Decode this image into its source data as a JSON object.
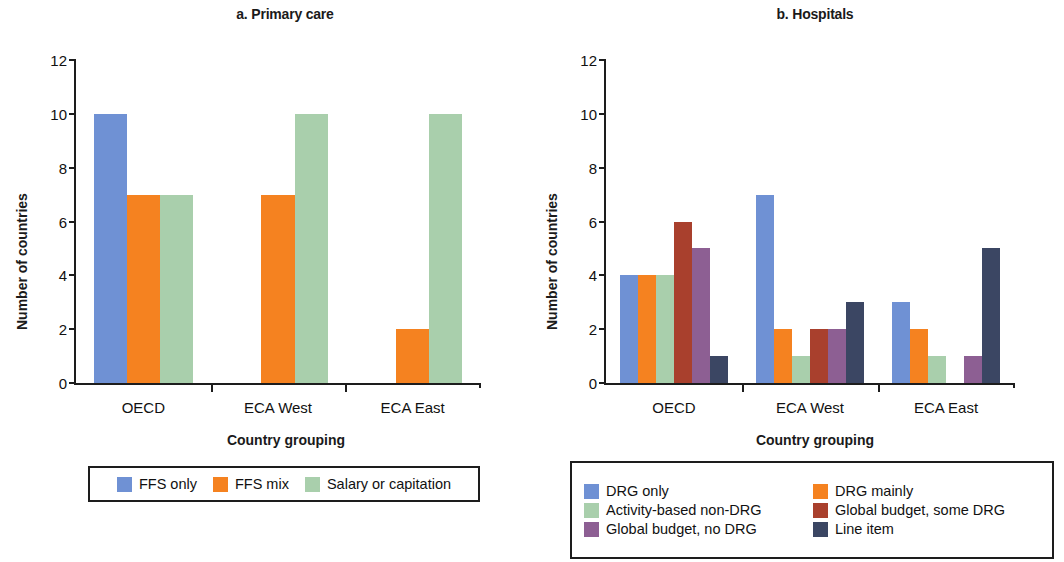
{
  "figure": {
    "panels": [
      {
        "id": "a",
        "title": "a. Primary care",
        "xlabel": "Country grouping",
        "ylabel": "Number of countries"
      },
      {
        "id": "b",
        "title": "b. Hospitals",
        "xlabel": "Country grouping",
        "ylabel": "Number of countries"
      }
    ]
  },
  "axis": {
    "yticks": [
      "0",
      "2",
      "4",
      "6",
      "8",
      "10",
      "12"
    ],
    "categories": [
      "OECD",
      "ECA West",
      "ECA East"
    ]
  },
  "colors": {
    "blue": "#6f91d4",
    "orange": "#f58220",
    "green": "#a9cfac",
    "brown": "#a9402d",
    "purple": "#8d5f93",
    "navy": "#3b4663",
    "axis": "#1d1d1d"
  },
  "chart_data": [
    {
      "type": "bar",
      "panel": "a",
      "title": "a. Primary care",
      "xlabel": "Country grouping",
      "ylabel": "Number of countries",
      "ylim": [
        0,
        12
      ],
      "yticks": [
        0,
        2,
        4,
        6,
        8,
        10,
        12
      ],
      "grid": false,
      "legend_position": "below",
      "categories": [
        "OECD",
        "ECA West",
        "ECA East"
      ],
      "series": [
        {
          "name": "FFS only",
          "color": "#6f91d4",
          "values": [
            10,
            0,
            0
          ]
        },
        {
          "name": "FFS mix",
          "color": "#f58220",
          "values": [
            7,
            7,
            2
          ]
        },
        {
          "name": "Salary or capitation",
          "color": "#a9cfac",
          "values": [
            7,
            10,
            10
          ]
        }
      ]
    },
    {
      "type": "bar",
      "panel": "b",
      "title": "b. Hospitals",
      "xlabel": "Country grouping",
      "ylabel": "Number of countries",
      "ylim": [
        0,
        12
      ],
      "yticks": [
        0,
        2,
        4,
        6,
        8,
        10,
        12
      ],
      "grid": false,
      "legend_position": "below",
      "categories": [
        "OECD",
        "ECA West",
        "ECA East"
      ],
      "series": [
        {
          "name": "DRG only",
          "color": "#6f91d4",
          "values": [
            4,
            7,
            3
          ]
        },
        {
          "name": "DRG mainly",
          "color": "#f58220",
          "values": [
            4,
            2,
            2
          ]
        },
        {
          "name": "Activity-based non-DRG",
          "color": "#a9cfac",
          "values": [
            4,
            1,
            1
          ]
        },
        {
          "name": "Global budget, some DRG",
          "color": "#a9402d",
          "values": [
            6,
            2,
            0
          ]
        },
        {
          "name": "Global budget, no DRG",
          "color": "#8d5f93",
          "values": [
            5,
            2,
            1
          ]
        },
        {
          "name": "Line item",
          "color": "#3b4663",
          "values": [
            1,
            3,
            5
          ]
        }
      ]
    }
  ]
}
